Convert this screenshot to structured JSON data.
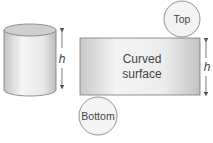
{
  "diagram": {
    "cylinder": {
      "height_label": "h"
    },
    "net": {
      "top_label": "Top",
      "bottom_label": "Bottom",
      "curved_label_line1": "Curved",
      "curved_label_line2": "surface",
      "height_label": "h"
    },
    "colors": {
      "stroke": "#666666",
      "fill_light": "#f2f2f2",
      "fill_dark": "#c8c8c8",
      "text": "#444444"
    }
  }
}
